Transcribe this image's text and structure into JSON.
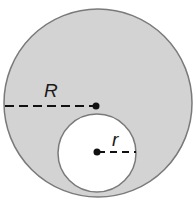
{
  "diagram": {
    "type": "annulus-offset-circles",
    "outer_circle": {
      "label": "R",
      "fill": "#d3d3d3",
      "stroke": "#7a7a7a"
    },
    "inner_circle": {
      "label": "r",
      "fill": "#ffffff",
      "stroke": "#7a7a7a"
    },
    "labels": {
      "outer_radius": "R",
      "inner_radius": "r"
    }
  }
}
